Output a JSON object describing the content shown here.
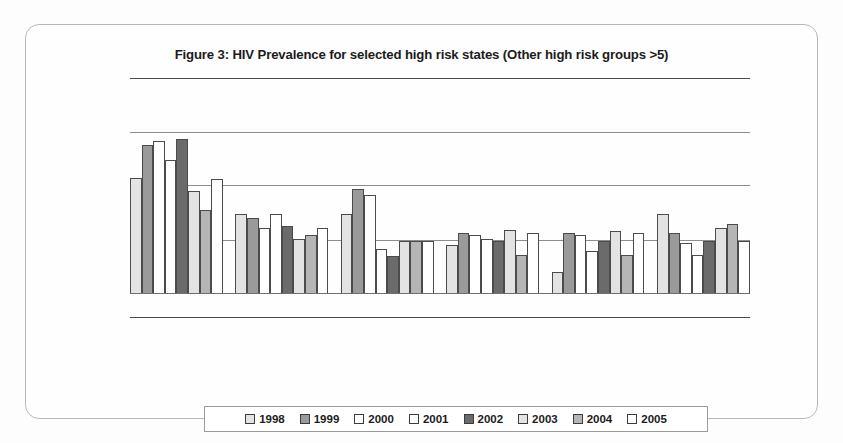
{
  "figure": {
    "title": "Figure 3: HIV Prevalence for selected high risk states (Other high risk groups >5)"
  },
  "legend": {
    "items": [
      {
        "label": "1998",
        "color": "#e3e3e3"
      },
      {
        "label": "1999",
        "color": "#9a9a9a"
      },
      {
        "label": "2000",
        "color": "#ffffff"
      },
      {
        "label": "2001",
        "color": "#ffffff"
      },
      {
        "label": "2002",
        "color": "#6b6b6b"
      },
      {
        "label": "2003",
        "color": "#e3e3e3"
      },
      {
        "label": "2004",
        "color": "#b5b5b5"
      },
      {
        "label": "2005",
        "color": "#ffffff"
      }
    ]
  },
  "chart_data": {
    "type": "bar",
    "title": "Figure 3: HIV Prevalence for selected high risk states (Other high risk groups >5)",
    "xlabel": "",
    "ylabel": "",
    "ylim": [
      0,
      5
    ],
    "grid": true,
    "gridlines": [
      1,
      2,
      3,
      4,
      5
    ],
    "legend_position": "bottom",
    "categories": [
      "State 1",
      "State 2",
      "State 3",
      "State 4",
      "State 5",
      "State 6"
    ],
    "series": [
      {
        "name": "1998",
        "color": "#e3e3e3",
        "values": [
          3.0,
          2.05,
          2.05,
          1.25,
          0.55,
          2.05
        ]
      },
      {
        "name": "1999",
        "color": "#9a9a9a",
        "values": [
          3.85,
          1.95,
          2.7,
          1.55,
          1.55,
          1.55
        ]
      },
      {
        "name": "2000",
        "color": "#ffffff",
        "values": [
          3.95,
          1.7,
          2.55,
          1.5,
          1.5,
          1.3
        ]
      },
      {
        "name": "2001",
        "color": "#ffffff",
        "values": [
          3.45,
          2.05,
          1.15,
          1.4,
          1.1,
          1.0
        ]
      },
      {
        "name": "2002",
        "color": "#6b6b6b",
        "values": [
          4.0,
          1.75,
          0.95,
          1.35,
          1.35,
          1.35
        ]
      },
      {
        "name": "2003",
        "color": "#e3e3e3",
        "values": [
          2.65,
          1.4,
          1.35,
          1.65,
          1.6,
          1.7
        ]
      },
      {
        "name": "2004",
        "color": "#b5b5b5",
        "values": [
          2.15,
          1.5,
          1.35,
          1.0,
          1.0,
          1.8
        ]
      },
      {
        "name": "2005",
        "color": "#ffffff",
        "values": [
          2.95,
          1.7,
          1.35,
          1.55,
          1.55,
          1.35
        ]
      }
    ]
  }
}
